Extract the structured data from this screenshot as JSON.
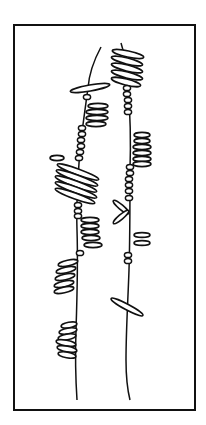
{
  "figure": {
    "colors": {
      "ink": "#111111",
      "background": "#ffffff"
    },
    "frame": {
      "x": 14,
      "y": 25,
      "width": 181,
      "height": 385
    },
    "stems": [
      {
        "name": "left-stem",
        "path": "M101,47 C94,60 89,74 88,88 C85,110 82,130 80,150 C78,175 76,200 77,230 C78,260 77,300 76,330 C75,360 76,385 77,400"
      },
      {
        "name": "right-stem",
        "path": "M121,43 C125,55 127,70 128,85 C130,110 131,140 130,170 C130,200 130,240 129,270 C128,300 126,330 126,360 C126,380 128,392 130,400"
      }
    ],
    "oval_clusters": [
      {
        "name": "right-top-cluster",
        "ovals": [
          {
            "cx": 128,
            "cy": 54,
            "rx": 16,
            "ry": 3,
            "rot": 12
          },
          {
            "cx": 127,
            "cy": 61,
            "rx": 16,
            "ry": 3,
            "rot": 14
          },
          {
            "cx": 127,
            "cy": 68,
            "rx": 16,
            "ry": 3,
            "rot": 14
          },
          {
            "cx": 127,
            "cy": 75,
            "rx": 16,
            "ry": 3,
            "rot": 14
          },
          {
            "cx": 126,
            "cy": 82,
            "rx": 15,
            "ry": 3,
            "rot": 14
          }
        ]
      },
      {
        "name": "left-crossbar",
        "ovals": [
          {
            "cx": 90,
            "cy": 88,
            "rx": 20,
            "ry": 3,
            "rot": -10
          }
        ]
      },
      {
        "name": "left-upper-cluster",
        "ovals": [
          {
            "cx": 98,
            "cy": 106,
            "rx": 10,
            "ry": 2.6,
            "rot": 0
          },
          {
            "cx": 97,
            "cy": 112,
            "rx": 11,
            "ry": 2.6,
            "rot": 0
          },
          {
            "cx": 97,
            "cy": 118,
            "rx": 11,
            "ry": 2.6,
            "rot": 0
          },
          {
            "cx": 96,
            "cy": 124,
            "rx": 10,
            "ry": 2.6,
            "rot": 0
          }
        ]
      },
      {
        "name": "right-middle-cluster",
        "ovals": [
          {
            "cx": 142,
            "cy": 135,
            "rx": 8,
            "ry": 2.6,
            "rot": 0
          },
          {
            "cx": 142,
            "cy": 141,
            "rx": 8,
            "ry": 2.6,
            "rot": 0
          },
          {
            "cx": 142,
            "cy": 147,
            "rx": 9,
            "ry": 2.6,
            "rot": 0
          },
          {
            "cx": 142,
            "cy": 153,
            "rx": 9,
            "ry": 2.6,
            "rot": 0
          },
          {
            "cx": 142,
            "cy": 159,
            "rx": 9,
            "ry": 2.6,
            "rot": 0
          },
          {
            "cx": 142,
            "cy": 164,
            "rx": 9,
            "ry": 2.6,
            "rot": 0
          }
        ]
      },
      {
        "name": "left-isolated-oval",
        "ovals": [
          {
            "cx": 57,
            "cy": 158,
            "rx": 7,
            "ry": 2.6,
            "rot": 0
          }
        ]
      },
      {
        "name": "left-dense-cluster",
        "ovals": [
          {
            "cx": 78,
            "cy": 172,
            "rx": 22,
            "ry": 3,
            "rot": 20
          },
          {
            "cx": 77,
            "cy": 178,
            "rx": 22,
            "ry": 3,
            "rot": 20
          },
          {
            "cx": 76,
            "cy": 184,
            "rx": 22,
            "ry": 3,
            "rot": 20
          },
          {
            "cx": 76,
            "cy": 190,
            "rx": 22,
            "ry": 3,
            "rot": 20
          },
          {
            "cx": 75,
            "cy": 196,
            "rx": 21,
            "ry": 3,
            "rot": 20
          }
        ]
      },
      {
        "name": "right-v-pair",
        "ovals": [
          {
            "cx": 121,
            "cy": 207,
            "rx": 10,
            "ry": 2.4,
            "rot": 40
          },
          {
            "cx": 121,
            "cy": 217,
            "rx": 10,
            "ry": 2.4,
            "rot": -40
          }
        ]
      },
      {
        "name": "left-mid-cluster",
        "ovals": [
          {
            "cx": 90,
            "cy": 220,
            "rx": 9,
            "ry": 2.6,
            "rot": 0
          },
          {
            "cx": 90,
            "cy": 226,
            "rx": 9,
            "ry": 2.6,
            "rot": 0
          },
          {
            "cx": 90,
            "cy": 232,
            "rx": 9,
            "ry": 2.6,
            "rot": 0
          },
          {
            "cx": 91,
            "cy": 238,
            "rx": 9,
            "ry": 2.6,
            "rot": 0
          },
          {
            "cx": 93,
            "cy": 245,
            "rx": 9,
            "ry": 2.6,
            "rot": 0
          }
        ]
      },
      {
        "name": "right-small-pair",
        "ovals": [
          {
            "cx": 142,
            "cy": 235,
            "rx": 8,
            "ry": 2.4,
            "rot": 0
          },
          {
            "cx": 142,
            "cy": 243,
            "rx": 8,
            "ry": 2.4,
            "rot": 0
          }
        ]
      },
      {
        "name": "left-lower-cluster",
        "ovals": [
          {
            "cx": 68,
            "cy": 263,
            "rx": 10,
            "ry": 2.8,
            "rot": -12
          },
          {
            "cx": 66,
            "cy": 270,
            "rx": 10,
            "ry": 2.8,
            "rot": -12
          },
          {
            "cx": 65,
            "cy": 277,
            "rx": 10,
            "ry": 2.8,
            "rot": -12
          },
          {
            "cx": 64,
            "cy": 284,
            "rx": 10,
            "ry": 2.8,
            "rot": -12
          },
          {
            "cx": 64,
            "cy": 290,
            "rx": 10,
            "ry": 2.8,
            "rot": -12
          }
        ]
      },
      {
        "name": "right-diagonal-bar",
        "ovals": [
          {
            "cx": 127,
            "cy": 307,
            "rx": 18,
            "ry": 2.8,
            "rot": 28
          }
        ]
      },
      {
        "name": "left-bottom-cluster",
        "ovals": [
          {
            "cx": 69,
            "cy": 325,
            "rx": 8,
            "ry": 2.8,
            "rot": -10
          },
          {
            "cx": 68,
            "cy": 331,
            "rx": 9,
            "ry": 2.8,
            "rot": -10
          },
          {
            "cx": 67,
            "cy": 337,
            "rx": 9,
            "ry": 2.8,
            "rot": -10
          },
          {
            "cx": 66,
            "cy": 343,
            "rx": 10,
            "ry": 2.8,
            "rot": 10
          },
          {
            "cx": 67,
            "cy": 349,
            "rx": 10,
            "ry": 2.8,
            "rot": 10
          },
          {
            "cx": 67,
            "cy": 355,
            "rx": 9,
            "ry": 2.8,
            "rot": 10
          }
        ]
      }
    ],
    "bead_chains": [
      {
        "name": "right-upper-beads",
        "beads": [
          {
            "cx": 127,
            "cy": 88
          },
          {
            "cx": 127,
            "cy": 94
          },
          {
            "cx": 128,
            "cy": 100
          },
          {
            "cx": 128,
            "cy": 106
          },
          {
            "cx": 128,
            "cy": 112
          }
        ]
      },
      {
        "name": "left-upper-bead",
        "beads": [
          {
            "cx": 87,
            "cy": 97
          }
        ]
      },
      {
        "name": "left-middle-beads",
        "beads": [
          {
            "cx": 82,
            "cy": 128
          },
          {
            "cx": 82,
            "cy": 134
          },
          {
            "cx": 81,
            "cy": 140
          },
          {
            "cx": 81,
            "cy": 146
          },
          {
            "cx": 80,
            "cy": 152
          },
          {
            "cx": 79,
            "cy": 158
          }
        ]
      },
      {
        "name": "right-middle-beads",
        "beads": [
          {
            "cx": 130,
            "cy": 167
          },
          {
            "cx": 130,
            "cy": 173
          },
          {
            "cx": 129,
            "cy": 179
          },
          {
            "cx": 129,
            "cy": 185
          },
          {
            "cx": 129,
            "cy": 191
          },
          {
            "cx": 129,
            "cy": 198
          }
        ]
      },
      {
        "name": "left-lower-beads",
        "beads": [
          {
            "cx": 78,
            "cy": 205
          },
          {
            "cx": 78,
            "cy": 211
          },
          {
            "cx": 78,
            "cy": 216
          }
        ]
      },
      {
        "name": "left-single-bead",
        "beads": [
          {
            "cx": 80,
            "cy": 253
          }
        ]
      },
      {
        "name": "right-lower-beads",
        "beads": [
          {
            "cx": 128,
            "cy": 255
          },
          {
            "cx": 128,
            "cy": 261
          }
        ]
      }
    ]
  }
}
